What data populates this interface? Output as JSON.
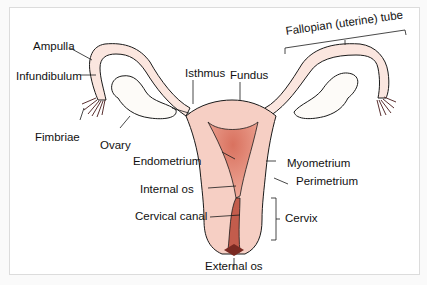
{
  "diagram": {
    "colors": {
      "outline": "#1a1a1a",
      "tissue": "#f6cfc4",
      "tube": "#fbe6df",
      "cavity": "#d9725f",
      "cavity_light": "#eea898",
      "ovary": "#fdfbf8",
      "background": "#ffffff",
      "frame_border": "#dcdcdc"
    },
    "labels": {
      "ampulla": "Ampulla",
      "infundibulum": "Infundibulum",
      "fimbriae": "Fimbriae",
      "ovary": "Ovary",
      "isthmus": "Isthmus",
      "fundus": "Fundus",
      "fallopian_tube": "Fallopian (uterine) tube",
      "endometrium": "Endometrium",
      "myometrium": "Myometrium",
      "perimetrium": "Perimetrium",
      "internal_os": "Internal os",
      "cervical_canal": "Cervical canal",
      "cervix": "Cervix",
      "external_os": "External os"
    }
  }
}
